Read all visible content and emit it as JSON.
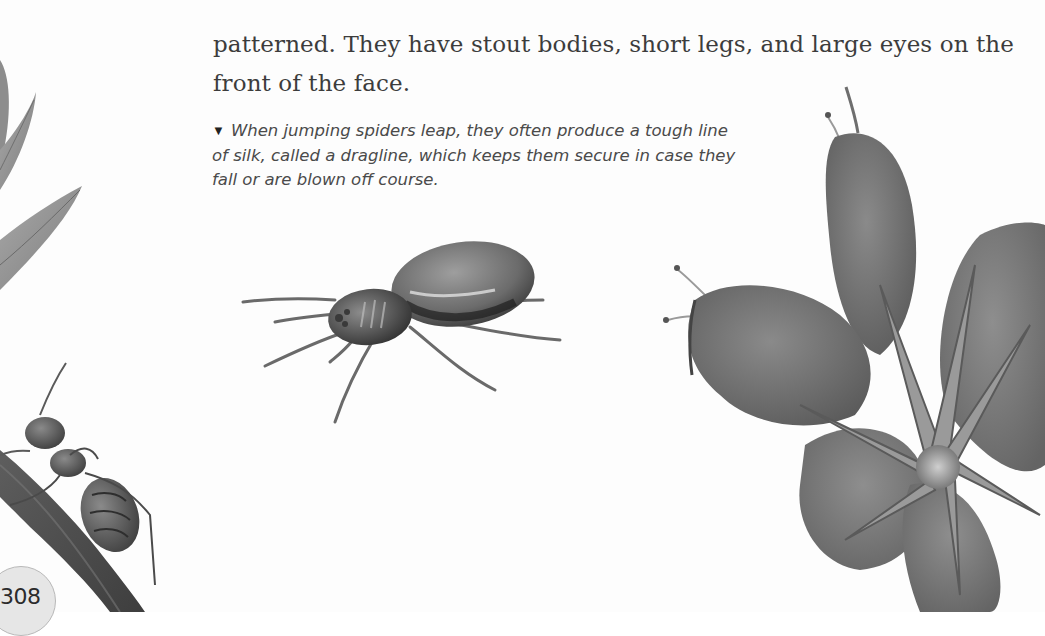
{
  "page": {
    "body_text": {
      "lines": [
        "patterned. They have stout bodies, short legs, and large eyes on the",
        "front of the face."
      ]
    },
    "caption": {
      "pointer": "▼",
      "lines": [
        "When jumping spiders leap, they often produce a tough line",
        "of silk, called a dragline, which keeps them secure in case they",
        "fall or are blown off course."
      ]
    },
    "page_number": "308",
    "illustrations": [
      {
        "name": "leaves",
        "description": "grayscale painted leaves at left edge"
      },
      {
        "name": "ant-on-stem",
        "description": "ant climbing a branch, lower left"
      },
      {
        "name": "jumping-spider",
        "description": "jumping spider in center"
      },
      {
        "name": "flower",
        "description": "open flower with buds at right"
      }
    ]
  }
}
